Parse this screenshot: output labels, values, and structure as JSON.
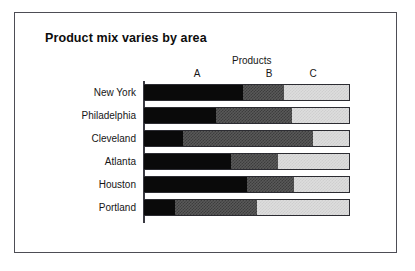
{
  "figure": {
    "title": "Product mix varies by area",
    "group_header": "Products",
    "frame_color": "#4d4d55",
    "background": "#ffffff"
  },
  "chart_data": {
    "type": "bar",
    "orientation": "horizontal",
    "stacked": true,
    "normalized": true,
    "title": "Product mix varies by area",
    "xlabel": "",
    "ylabel": "",
    "legend_title": "Products",
    "legend_position": "top",
    "grid": false,
    "xlim": [
      0,
      100
    ],
    "axis_line": "left-vertical",
    "categories": [
      "New York",
      "Philadelphia",
      "Cleveland",
      "Atlanta",
      "Houston",
      "Portland"
    ],
    "series": [
      {
        "name": "A",
        "fill": "solid-black",
        "color": "#0a0a0a",
        "values": [
          48,
          35,
          19,
          42,
          50,
          15
        ]
      },
      {
        "name": "B",
        "fill": "dark-grey-hatch",
        "color": "#595959",
        "values": [
          20,
          37,
          63,
          23,
          23,
          40
        ]
      },
      {
        "name": "C",
        "fill": "light-grey-hatch",
        "color": "#dddddd",
        "values": [
          32,
          28,
          18,
          35,
          27,
          45
        ]
      }
    ],
    "column_labels": [
      "A",
      "B",
      "C"
    ]
  }
}
